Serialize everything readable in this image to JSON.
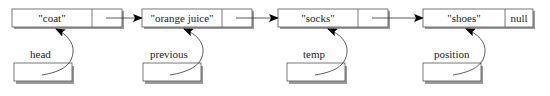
{
  "diagram": {
    "type": "linked-list",
    "colors": {
      "box_fill": "#ffffff",
      "box_stroke": "#555555",
      "shadow": "#9a9a9a",
      "line": "#333333",
      "arrowhead": "#000000"
    },
    "nodes": [
      {
        "value": "\"coat\"",
        "next": ""
      },
      {
        "value": "\"orange juice\"",
        "next": ""
      },
      {
        "value": "\"socks\"",
        "next": ""
      },
      {
        "value": "\"shoes\"",
        "next": "null"
      }
    ],
    "pointers": [
      {
        "label": "head",
        "target_node": 0
      },
      {
        "label": "previous",
        "target_node": 1
      },
      {
        "label": "temp",
        "target_node": 2
      },
      {
        "label": "position",
        "target_node": 3
      }
    ]
  }
}
